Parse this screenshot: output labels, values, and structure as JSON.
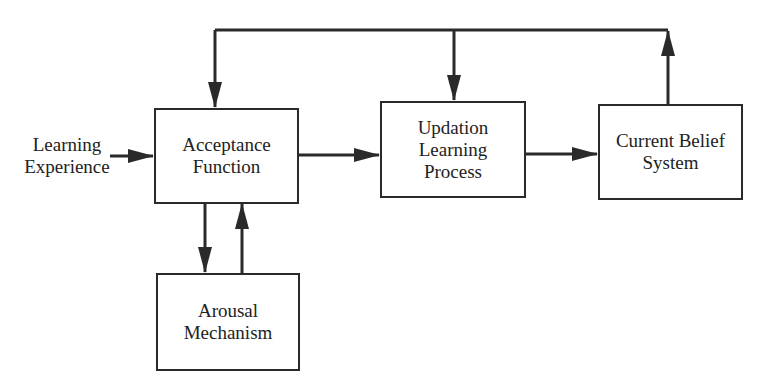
{
  "diagram": {
    "input_label": [
      "Learning",
      "Experience"
    ],
    "nodes": [
      {
        "id": "acceptance",
        "lines": [
          "Acceptance",
          "Function"
        ]
      },
      {
        "id": "updation",
        "lines": [
          "Updation",
          "Learning",
          "Process"
        ]
      },
      {
        "id": "belief",
        "lines": [
          "Current Belief",
          "System"
        ]
      },
      {
        "id": "arousal",
        "lines": [
          "Arousal",
          "Mechanism"
        ]
      }
    ],
    "edges": [
      {
        "from": "Learning Experience",
        "to": "acceptance"
      },
      {
        "from": "acceptance",
        "to": "updation"
      },
      {
        "from": "updation",
        "to": "belief"
      },
      {
        "from": "belief",
        "to": "feedback-bus"
      },
      {
        "from": "feedback-bus",
        "to": "acceptance"
      },
      {
        "from": "feedback-bus",
        "to": "updation"
      },
      {
        "from": "acceptance",
        "to": "arousal"
      },
      {
        "from": "arousal",
        "to": "acceptance"
      }
    ],
    "colors": {
      "line": "#2a2a2a",
      "background": "#ffffff"
    }
  }
}
